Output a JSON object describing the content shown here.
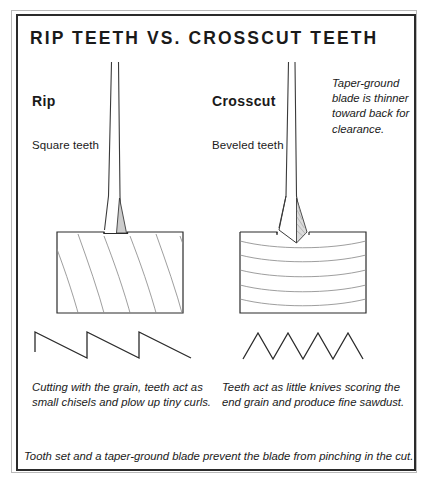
{
  "figure": {
    "title": "RIP TEETH VS. CROSSCUT TEETH",
    "footer_note": "Tooth set and a taper-ground blade prevent the blade from pinching in the cut.",
    "border_color": "#2b2b2b",
    "outer_border_color": "#b9b9b9",
    "line_color": "#3a3a3a",
    "shade_color": "#cfcfcf",
    "background": "#ffffff"
  },
  "columns": {
    "rip": {
      "heading": "Rip",
      "sub_label": "Square teeth",
      "caption": "Cutting with the grain, teeth act as small chisels and plow up tiny curls.",
      "tooth_profile": "sawtooth-rip",
      "grain": "diagonal",
      "kerf_bottom": "flat"
    },
    "crosscut": {
      "heading": "Crosscut",
      "sub_label": "Beveled teeth",
      "caption": "Teeth act as little knives scoring the end grain and produce fine sawdust.",
      "tooth_profile": "sawtooth-crosscut",
      "grain": "horizontal-curved",
      "kerf_bottom": "vee"
    }
  },
  "annotation": {
    "taper_note": "Taper-ground blade is thinner toward back for clearance."
  }
}
